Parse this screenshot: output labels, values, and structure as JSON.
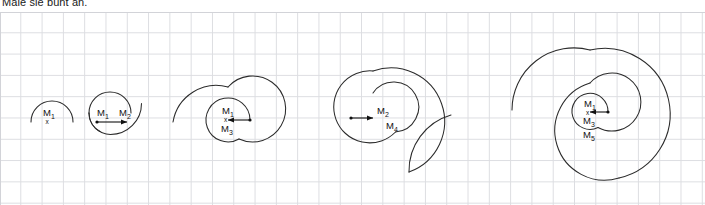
{
  "worksheet": {
    "instruction": "Male sie bunt an.",
    "colors": {
      "ink": "#2b2b2b",
      "grid": "#dcdde1",
      "paper": "#ffffff"
    }
  },
  "grid": {
    "cell_px": 21.3,
    "visible": true
  },
  "figures": [
    {
      "id": "figure-1",
      "arc_count": 1,
      "center_labels": [
        "M1"
      ],
      "point_marker": "x",
      "arrow": null,
      "labels": {
        "m1": "M",
        "m1_sub": "1"
      }
    },
    {
      "id": "figure-2",
      "arc_count": 2,
      "center_labels": [
        "M1",
        "M2"
      ],
      "point_marker": "x",
      "arrow": "right",
      "labels": {
        "m1": "M",
        "m1_sub": "1",
        "m2": "M",
        "m2_sub": "2"
      }
    },
    {
      "id": "figure-3",
      "arc_count": 3,
      "center_labels": [
        "M1",
        "M3"
      ],
      "point_marker": "x",
      "arrow": "left",
      "labels": {
        "m1": "M",
        "m1_sub": "1",
        "m3": "M",
        "m3_sub": "3"
      }
    },
    {
      "id": "figure-4",
      "arc_count": 4,
      "center_labels": [
        "M2",
        "M4"
      ],
      "point_marker": "x",
      "arrow": "right",
      "labels": {
        "m2": "M",
        "m2_sub": "2",
        "m4": "M",
        "m4_sub": "4"
      }
    },
    {
      "id": "figure-5",
      "arc_count": 5,
      "center_labels": [
        "M1",
        "M3",
        "M5"
      ],
      "point_marker": "x",
      "arrow": "left",
      "labels": {
        "m1": "M",
        "m1_sub": "1",
        "m3": "M",
        "m3_sub": "3",
        "m5": "M",
        "m5_sub": "5"
      }
    }
  ]
}
